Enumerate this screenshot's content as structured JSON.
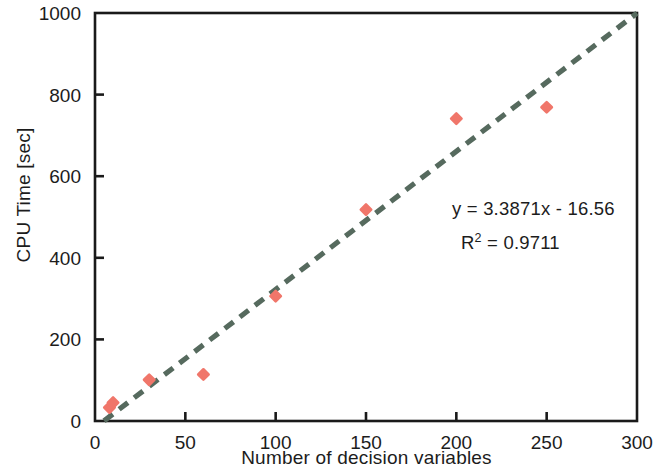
{
  "chart_data": {
    "type": "scatter",
    "title": "",
    "xlabel": "Number of decision variables",
    "ylabel": "CPU Time [sec]",
    "xlim": [
      0,
      300
    ],
    "ylim": [
      0,
      1000
    ],
    "xticks": [
      0,
      50,
      100,
      150,
      200,
      250,
      300
    ],
    "yticks": [
      0,
      200,
      400,
      600,
      800,
      1000
    ],
    "xtick_labels": [
      "0",
      "50",
      "100",
      "150",
      "200",
      "250",
      "300"
    ],
    "ytick_labels": [
      "0",
      "200",
      "400",
      "600",
      "800",
      "1000"
    ],
    "grid": false,
    "legend": null,
    "series": [
      {
        "name": "CPU Time",
        "marker": "diamond",
        "color": "#F0766A",
        "points": [
          {
            "x": 8,
            "y": 33
          },
          {
            "x": 10,
            "y": 45
          },
          {
            "x": 30,
            "y": 101
          },
          {
            "x": 60,
            "y": 114
          },
          {
            "x": 100,
            "y": 306
          },
          {
            "x": 150,
            "y": 518
          },
          {
            "x": 200,
            "y": 741
          },
          {
            "x": 250,
            "y": 769
          }
        ]
      }
    ],
    "trendline": {
      "name": "Linear trendline",
      "style": "dashed",
      "color": "#566A5E",
      "slope": 3.3871,
      "intercept": -16.56,
      "x_start": 5,
      "x_end": 300
    },
    "annotations": {
      "equation": "y = 3.3871x - 16.56",
      "r_squared_prefix": "R",
      "r_squared_exponent": "2",
      "r_squared_value": " = 0.9711"
    }
  },
  "axes": {
    "frame_color": "#1a1a1a"
  }
}
